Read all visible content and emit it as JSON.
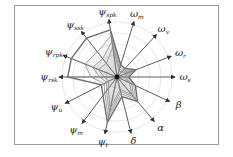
{
  "chart_data": {
    "type": "radar",
    "title": "",
    "center": [
      117,
      77
    ],
    "axis_length": 58,
    "axes": [
      {
        "label": "ψ",
        "sub": "s_pk",
        "angle": -98
      },
      {
        "label": "ω",
        "sub": "m",
        "angle": -73
      },
      {
        "label": "ω",
        "sub": "v",
        "angle": -47
      },
      {
        "label": "ω",
        "sub": "r",
        "angle": -21
      },
      {
        "label": "ω",
        "sub": "s",
        "angle": 0
      },
      {
        "label": "β",
        "sub": "",
        "angle": 25
      },
      {
        "label": "α",
        "sub": "",
        "angle": 50
      },
      {
        "label": "δ",
        "sub": "",
        "angle": 76
      },
      {
        "label": "ψ",
        "sub": "t",
        "angle": 102
      },
      {
        "label": "ψ",
        "sub": "m",
        "angle": 127
      },
      {
        "label": "ψ",
        "sub": "u",
        "angle": 153
      },
      {
        "label": "ψ",
        "sub": "r_sk",
        "angle": 180
      },
      {
        "label": "ψ",
        "sub": "r_pk",
        "angle": -158
      },
      {
        "label": "ψ",
        "sub": "s_sk",
        "angle": -128
      }
    ],
    "series": [
      {
        "name": "outer",
        "values": [
          0.82,
          0.22,
          0.2,
          0.35,
          0.2,
          0.35,
          0.55,
          0.35,
          0.8,
          0.4,
          0.3,
          0.85,
          0.85,
          0.85
        ]
      },
      {
        "name": "s2",
        "values": [
          0.72,
          0.18,
          0.17,
          0.3,
          0.17,
          0.32,
          0.5,
          0.3,
          0.72,
          0.35,
          0.25,
          0.45,
          0.6,
          0.55
        ]
      },
      {
        "name": "s3",
        "values": [
          0.62,
          0.15,
          0.14,
          0.26,
          0.14,
          0.28,
          0.45,
          0.26,
          0.64,
          0.3,
          0.2,
          0.3,
          0.45,
          0.4
        ]
      },
      {
        "name": "s4",
        "values": [
          0.52,
          0.12,
          0.11,
          0.22,
          0.11,
          0.24,
          0.4,
          0.22,
          0.56,
          0.25,
          0.16,
          0.22,
          0.35,
          0.3
        ]
      }
    ],
    "grid_rings": [
      0.2,
      0.4,
      0.6,
      0.8,
      1.0
    ],
    "grid": true,
    "legend": null
  },
  "colors": {
    "frame": "#9a9a9a",
    "axis": "#333333",
    "grid": "#e6e6e6",
    "outer_polygon": "#6e6e6e",
    "inner_polygons": "#9b9b9b",
    "center_dot": "#111111"
  }
}
